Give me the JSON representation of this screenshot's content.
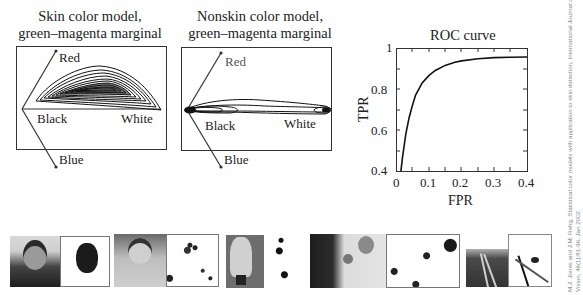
{
  "figure": {
    "skin_panel": {
      "title_line1": "Skin color model,",
      "title_line2": "green–magenta marginal",
      "labels": {
        "red": "Red",
        "black": "Black",
        "white": "White",
        "blue": "Blue"
      }
    },
    "nonskin_panel": {
      "title_line1": "Nonskin color model,",
      "title_line2": "green–magenta marginal",
      "labels": {
        "red": "Red",
        "black": "Black",
        "white": "White",
        "blue": "Blue"
      }
    },
    "citation": {
      "line1": "M.J. Jones and J.M. Rehg, Statistical color models with application to skin detection, International Journal of Computer",
      "line2": "Vision, 46(1):81-96, Jan 2002."
    },
    "image_strip": [
      {
        "photo": "man-in-suit-portrait",
        "mask": "skin-detection-mask-face"
      },
      {
        "photo": "smiling-woman-portrait",
        "mask": "skin-detection-mask-scattered"
      },
      {
        "photo": "child-standing",
        "mask": "skin-detection-mask-small-blobs"
      },
      {
        "photo": "man-holding-baby",
        "mask": "skin-detection-mask-blobs"
      },
      {
        "photo": "railroad-tracks",
        "mask": "skin-detection-mask-false-positives"
      }
    ]
  },
  "chart_data": {
    "type": "line",
    "title": "ROC curve",
    "xlabel": "FPR",
    "ylabel": "TPR",
    "xlim": [
      0,
      0.4
    ],
    "ylim": [
      0.4,
      1
    ],
    "xticks": [
      "0",
      "0.1",
      "0.2",
      "0.3",
      "0.4"
    ],
    "yticks": [
      "0.4",
      "0.6",
      "0.8",
      "1"
    ],
    "grid": false,
    "legend": null,
    "series": [
      {
        "name": "ROC",
        "x": [
          0.015,
          0.02,
          0.03,
          0.04,
          0.05,
          0.06,
          0.08,
          0.1,
          0.12,
          0.15,
          0.18,
          0.2,
          0.25,
          0.3,
          0.35,
          0.4
        ],
        "y": [
          0.4,
          0.47,
          0.58,
          0.66,
          0.72,
          0.77,
          0.83,
          0.865,
          0.89,
          0.915,
          0.93,
          0.937,
          0.948,
          0.953,
          0.955,
          0.956
        ]
      }
    ]
  }
}
